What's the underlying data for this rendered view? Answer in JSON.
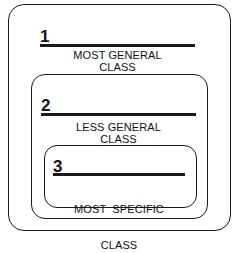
{
  "diagram": {
    "type": "nested-classes",
    "classes": [
      {
        "number": "1",
        "line1": "MOST GENERAL",
        "line2": "CLASS"
      },
      {
        "number": "2",
        "line1": "LESS GENERAL",
        "line2": "CLASS"
      },
      {
        "number": "3",
        "line1": "MOST  SPECIFIC",
        "line2": "CLASS"
      }
    ]
  }
}
